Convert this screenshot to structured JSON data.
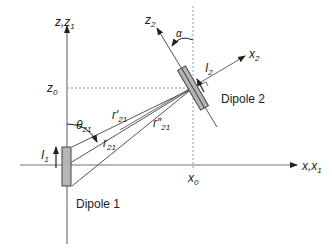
{
  "diagram": {
    "axes": {
      "z_label": "z,z",
      "z_label_sub": "1",
      "x_label": "x,x",
      "x_label_sub": "1",
      "z0_label": "z",
      "z0_sub": "0",
      "x0_label": "x",
      "x0_sub": "0"
    },
    "dipole2_axes": {
      "z2_label": "z",
      "z2_sub": "2",
      "x2_label": "x",
      "x2_sub": "2",
      "alpha_label": "α"
    },
    "dipoles": [
      {
        "name": "Dipole 1",
        "current_label": "I",
        "current_sub": "1"
      },
      {
        "name": "Dipole 2",
        "current_label": "I",
        "current_sub": "2"
      }
    ],
    "distances": {
      "r21": {
        "label": "r",
        "sub": "21"
      },
      "r21_prime": {
        "label": "r′",
        "sub": "21"
      },
      "r21_double_prime": {
        "label": "r″",
        "sub": "21"
      }
    },
    "angle": {
      "label": "θ",
      "sub": "21"
    },
    "colors": {
      "line": "#555555",
      "axis": "#777777",
      "dipole_fill": "#b5b5b5",
      "dipole_stroke": "#444444",
      "text": "#222222"
    }
  }
}
